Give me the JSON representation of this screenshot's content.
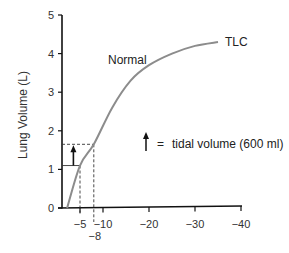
{
  "chart_data": {
    "type": "line",
    "title": "",
    "xlabel": "",
    "ylabel": "Lung Volume (L)",
    "xlim": [
      0,
      -40
    ],
    "ylim": [
      0,
      5
    ],
    "grid": false,
    "x_ticks": [
      {
        "value": -5,
        "label": "−5"
      },
      {
        "value": -10,
        "label": "−10"
      },
      {
        "value": -20,
        "label": "−20"
      },
      {
        "value": -30,
        "label": "−30"
      },
      {
        "value": -40,
        "label": "−40"
      }
    ],
    "extra_x_label": {
      "value": -8,
      "label": "−8"
    },
    "y_ticks": [
      {
        "value": 0,
        "label": "0"
      },
      {
        "value": 1,
        "label": "1"
      },
      {
        "value": 2,
        "label": "2"
      },
      {
        "value": 3,
        "label": "3"
      },
      {
        "value": 4,
        "label": "4"
      },
      {
        "value": 5,
        "label": "5"
      }
    ],
    "series": [
      {
        "name": "Normal",
        "color": "#8c8c8c",
        "points": [
          {
            "x": -2.2,
            "y": 0.0
          },
          {
            "x": -5,
            "y": 1.1
          },
          {
            "x": -8,
            "y": 1.65
          },
          {
            "x": -12,
            "y": 2.6
          },
          {
            "x": -16,
            "y": 3.3
          },
          {
            "x": -20,
            "y": 3.7
          },
          {
            "x": -25,
            "y": 4.0
          },
          {
            "x": -30,
            "y": 4.2
          },
          {
            "x": -35,
            "y": 4.3
          }
        ]
      }
    ],
    "annotations": [
      {
        "text": "Normal",
        "x": -11,
        "y": 3.85
      },
      {
        "text": "TLC",
        "x": -36.5,
        "y": 4.3
      },
      {
        "type": "tidal-volume-arrow",
        "x": -4,
        "y_from": 1.1,
        "y_to": 1.65
      },
      {
        "type": "dashed-guides",
        "points": [
          {
            "x": -5,
            "y": 1.1
          },
          {
            "x": -8,
            "y": 1.65
          }
        ]
      }
    ],
    "legend": {
      "symbol": "up-arrow",
      "text": "= tidal volume (600 ml)"
    }
  },
  "labels": {
    "normal": "Normal",
    "tlc": "TLC",
    "legend_eq": "=",
    "legend_text": "tidal volume (600 ml)",
    "ylabel": "Lung Volume (L)",
    "minus8": "−8"
  }
}
